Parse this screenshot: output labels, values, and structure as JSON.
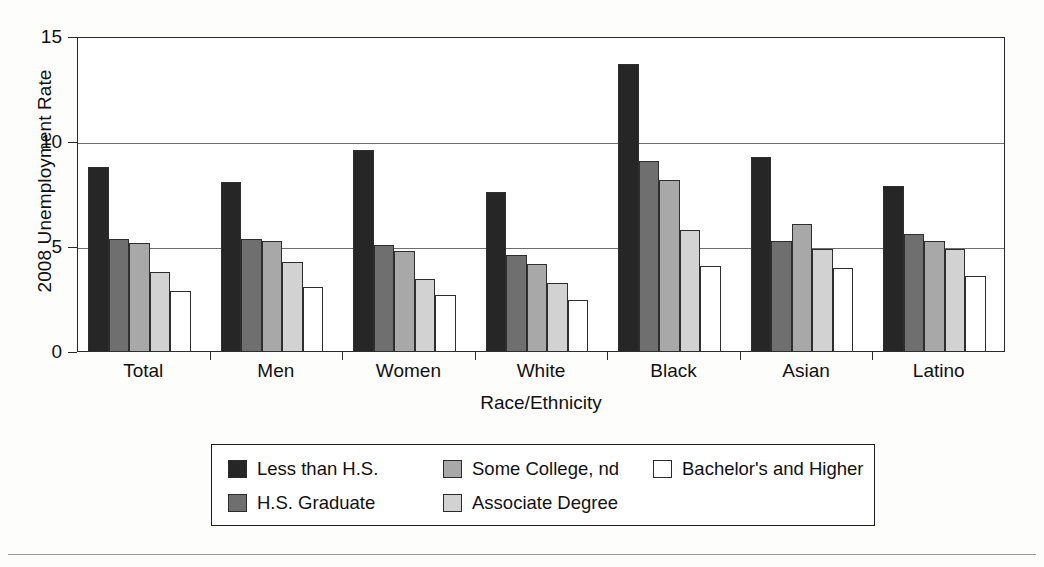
{
  "chart_data": {
    "type": "bar",
    "title": "",
    "xlabel": "Race/Ethnicity",
    "ylabel": "2008 Unemployment Rate",
    "ylim": [
      0,
      15
    ],
    "yticks": [
      0,
      5,
      10,
      15
    ],
    "grid": true,
    "legend_position": "bottom",
    "categories": [
      "Total",
      "Men",
      "Women",
      "White",
      "Black",
      "Asian",
      "Latino"
    ],
    "series": [
      {
        "name": "Less than H.S.",
        "color": "#262626",
        "values": [
          8.8,
          8.1,
          9.6,
          7.6,
          13.7,
          9.3,
          7.9
        ]
      },
      {
        "name": "H.S. Graduate",
        "color": "#6f6f6f",
        "values": [
          5.4,
          5.4,
          5.1,
          4.6,
          9.1,
          5.3,
          5.6
        ]
      },
      {
        "name": "Some College, nd",
        "color": "#a8a8a8",
        "values": [
          5.2,
          5.3,
          4.8,
          4.2,
          8.2,
          6.1,
          5.3
        ]
      },
      {
        "name": "Associate Degree",
        "color": "#d2d2d2",
        "values": [
          3.8,
          4.3,
          3.5,
          3.3,
          5.8,
          4.9,
          4.9
        ]
      },
      {
        "name": "Bachelor's and Higher",
        "color": "#ffffff",
        "values": [
          2.9,
          3.1,
          2.7,
          2.5,
          4.1,
          4.0,
          3.6
        ]
      }
    ]
  },
  "axes": {
    "y_title": "2008 Unemployment Rate",
    "x_title": "Race/Ethnicity",
    "y_tick_labels": [
      "15",
      "10",
      "5",
      "0"
    ],
    "x_tick_labels": [
      "Total",
      "Men",
      "Women",
      "White",
      "Black",
      "Asian",
      "Latino"
    ]
  },
  "legend": {
    "items": [
      {
        "label": "Less than H.S.",
        "color": "#262626"
      },
      {
        "label": "H.S. Graduate",
        "color": "#6f6f6f"
      },
      {
        "label": "Some College, nd",
        "color": "#a8a8a8"
      },
      {
        "label": "Associate Degree",
        "color": "#d2d2d2"
      },
      {
        "label": "Bachelor's and Higher",
        "color": "#ffffff"
      }
    ]
  }
}
